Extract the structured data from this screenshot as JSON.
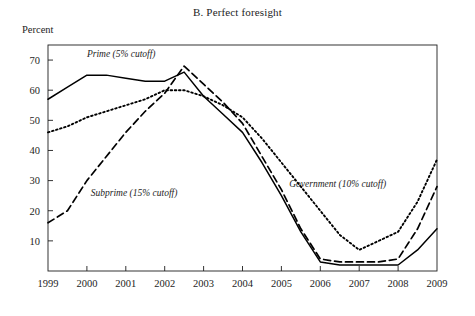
{
  "figure": {
    "title": "B. Perfect foresight",
    "y_axis_caption": "Percent"
  },
  "chart_data": {
    "type": "line",
    "title": "B. Perfect foresight",
    "xlabel": "",
    "ylabel": "Percent",
    "xlim": [
      1999,
      2009
    ],
    "ylim": [
      0,
      75
    ],
    "yticks": [
      10,
      20,
      30,
      40,
      50,
      60,
      70
    ],
    "xticks": [
      1999,
      2000,
      2001,
      2002,
      2003,
      2004,
      2005,
      2006,
      2007,
      2008,
      2009
    ],
    "grid": false,
    "legend_position": "inline-annotations",
    "x": [
      1999,
      1999.5,
      2000,
      2000.5,
      2001,
      2001.5,
      2002,
      2002.5,
      2003,
      2003.5,
      2004,
      2004.5,
      2005,
      2005.5,
      2006,
      2006.5,
      2007,
      2007.5,
      2008,
      2008.5,
      2009
    ],
    "series": [
      {
        "name": "Prime (5% cutoff)",
        "style": "solid",
        "color": "#000000",
        "values": [
          57,
          61,
          65,
          65,
          64,
          63,
          63,
          66,
          58,
          52,
          46,
          36,
          25,
          13,
          3,
          2,
          2,
          2,
          2,
          7,
          14
        ]
      },
      {
        "name": "Subprime (15% cutoff)",
        "style": "dashed",
        "color": "#000000",
        "values": [
          16,
          20,
          30,
          38,
          46,
          53,
          59,
          68,
          62,
          56,
          49,
          38,
          27,
          14,
          4,
          3,
          3,
          3,
          4,
          14,
          28
        ]
      },
      {
        "name": "Government (10% cutoff)",
        "style": "dotted",
        "color": "#000000",
        "values": [
          46,
          48,
          51,
          53,
          55,
          57,
          60,
          60,
          58,
          55,
          51,
          44,
          36,
          28,
          20,
          12,
          7,
          10,
          13,
          23,
          37
        ]
      }
    ],
    "annotations": [
      {
        "label": "Prime (5% cutoff)",
        "x": 2000.0,
        "y": 71
      },
      {
        "label": "Subprime (15% cutoff)",
        "x": 2000.1,
        "y": 25
      },
      {
        "label": "Government (10% cutoff)",
        "x": 2005.2,
        "y": 28
      }
    ]
  }
}
